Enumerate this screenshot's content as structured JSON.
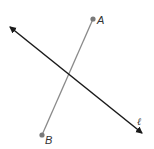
{
  "diagram": {
    "points": [
      {
        "id": "A",
        "label": "A",
        "x": 93,
        "y": 19
      },
      {
        "id": "B",
        "label": "B",
        "x": 42,
        "y": 135
      }
    ],
    "segment": {
      "from": "A",
      "to": "B",
      "color": "#8a8a8a"
    },
    "line": {
      "label": "ℓ",
      "x1": 9,
      "y1": 26,
      "x2": 143,
      "y2": 134,
      "color": "#1a1a1a",
      "arrows": "both"
    },
    "point_color": "#7a7a7a"
  }
}
